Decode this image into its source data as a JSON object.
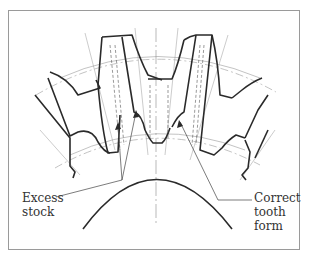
{
  "figure": {
    "type": "technical-diagram",
    "callouts": [
      {
        "id": "excess-stock",
        "lines": [
          "Excess",
          "stock"
        ]
      },
      {
        "id": "correct-tooth-form",
        "lines": [
          "Correct",
          "tooth",
          "form"
        ]
      }
    ]
  },
  "colors": {
    "line": "#2a2a2a",
    "thin_line": "#8a8a8a",
    "frame": "#999999",
    "background": "#ffffff"
  }
}
